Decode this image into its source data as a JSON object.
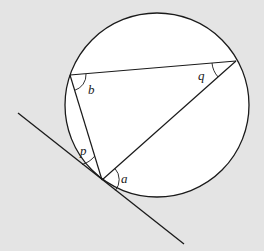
{
  "diagram": {
    "background": "#e4e4e4",
    "circle": {
      "cx": 157,
      "cy": 105,
      "r": 92,
      "fill": "#ffffff",
      "stroke": "#1a1a1a"
    },
    "points": {
      "B": {
        "x": 70,
        "y": 75
      },
      "Q": {
        "x": 236,
        "y": 61
      },
      "T": {
        "x": 102,
        "y": 180
      }
    },
    "tangent": {
      "x1": 18,
      "y1": 113,
      "x2": 184,
      "y2": 244
    },
    "labels": {
      "b": "b",
      "q": "q",
      "p": "p",
      "a": "a"
    }
  }
}
